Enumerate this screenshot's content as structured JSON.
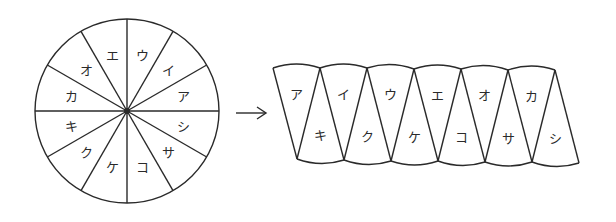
{
  "figure": {
    "stroke_color": "#2a2a2a",
    "background_color": "#ffffff"
  },
  "circle": {
    "center": [
      127,
      111
    ],
    "radius": 92,
    "sector_count": 12,
    "center_dot_radius": 3,
    "label_radius": 58,
    "sectors": [
      {
        "label": "ウ",
        "angle_deg": 15
      },
      {
        "label": "イ",
        "angle_deg": 45
      },
      {
        "label": "ア",
        "angle_deg": 75
      },
      {
        "label": "シ",
        "angle_deg": 105
      },
      {
        "label": "サ",
        "angle_deg": 135
      },
      {
        "label": "コ",
        "angle_deg": 165
      },
      {
        "label": "ケ",
        "angle_deg": 195
      },
      {
        "label": "ク",
        "angle_deg": 225
      },
      {
        "label": "キ",
        "angle_deg": 255
      },
      {
        "label": "カ",
        "angle_deg": 285
      },
      {
        "label": "オ",
        "angle_deg": 315
      },
      {
        "label": "エ",
        "angle_deg": 345
      }
    ]
  },
  "arrow": {
    "from": [
      236,
      113
    ],
    "to": [
      266,
      113
    ]
  },
  "strip": {
    "top_vertices": [
      [
        273,
        68
      ],
      [
        320,
        68
      ],
      [
        367,
        68
      ],
      [
        414,
        69
      ],
      [
        461,
        69
      ],
      [
        508,
        70
      ],
      [
        555,
        70
      ]
    ],
    "bottom_vertices": [
      [
        297,
        159
      ],
      [
        344,
        160
      ],
      [
        391,
        161
      ],
      [
        438,
        161
      ],
      [
        485,
        162
      ],
      [
        532,
        162
      ],
      [
        579,
        163
      ]
    ],
    "arc_bulge": 4,
    "top_labels": [
      "ア",
      "イ",
      "ウ",
      "エ",
      "オ",
      "カ"
    ],
    "bottom_labels": [
      "キ",
      "ク",
      "ケ",
      "コ",
      "サ",
      "シ"
    ]
  }
}
